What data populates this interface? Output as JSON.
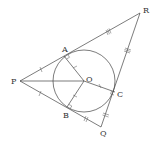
{
  "diagram": {
    "points": {
      "P": {
        "label": "P",
        "x": 20,
        "y": 81
      },
      "R": {
        "label": "R",
        "x": 140,
        "y": 13
      },
      "Q": {
        "label": "Q",
        "x": 101,
        "y": 127
      },
      "A": {
        "label": "A",
        "x": 64,
        "y": 56
      },
      "B": {
        "label": "B",
        "x": 67,
        "y": 107
      },
      "C": {
        "label": "C",
        "x": 115,
        "y": 92
      },
      "O": {
        "label": "O",
        "x": 84,
        "y": 81
      }
    },
    "circle": {
      "center": "O",
      "radius": 31
    },
    "segments": [
      "PR",
      "RQ",
      "PQ",
      "PO",
      "OA",
      "OB",
      "OC"
    ],
    "tick_marks": {
      "PA_PB": "single",
      "OA_OB_OC": "single-radius",
      "AR_RC": "triple",
      "BQ_QC": "double"
    },
    "right_angles": [
      "A",
      "B",
      "C"
    ]
  }
}
